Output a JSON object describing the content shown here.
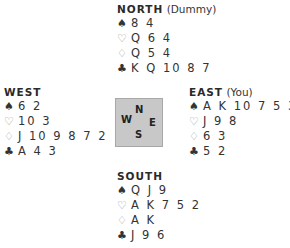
{
  "hands": {
    "north": {
      "seat": "NORTH",
      "role": "(Dummy)",
      "spades": "8 4",
      "hearts": "Q 6 4",
      "diamonds": "Q 5 4",
      "clubs": "K Q 10 8 7"
    },
    "west": {
      "seat": "WEST",
      "role": "",
      "spades": "6 2",
      "hearts": "10 3",
      "diamonds": "J 10 9 8 7 2",
      "clubs": "A 4 3"
    },
    "east": {
      "seat": "EAST",
      "role": "(You)",
      "spades": "A K 10 7 5 3",
      "hearts": "J 9 8",
      "diamonds": "6 3",
      "clubs": "5 2"
    },
    "south": {
      "seat": "SOUTH",
      "role": "",
      "spades": "Q J 9",
      "hearts": "A K 7 5 2",
      "diamonds": "A K",
      "clubs": "J 9 6"
    }
  },
  "suit_symbols": {
    "spades": "♠",
    "hearts": "♡",
    "diamonds": "♢",
    "clubs": "♣"
  },
  "compass": {
    "n": "N",
    "w": "W",
    "e": "E",
    "s": "S"
  },
  "colors": {
    "text": "#333333",
    "compass_bg": "#c8c8c8",
    "light_suit": "#9a9a9a"
  }
}
